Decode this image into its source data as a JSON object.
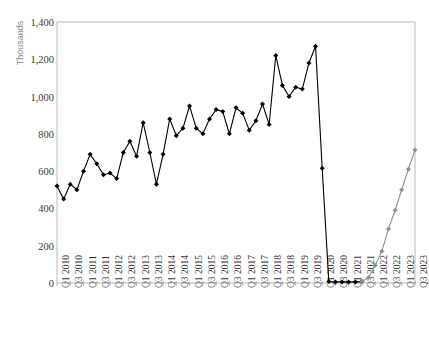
{
  "chart_data": {
    "type": "line",
    "title": "",
    "xlabel": "",
    "ylabel": "Thousands",
    "ylim": [
      0,
      1400
    ],
    "ytick_step": 200,
    "ytick_labels": [
      "1,400",
      "1,200",
      "1,000",
      "800",
      "600",
      "400",
      "200",
      "0"
    ],
    "ytick_values": [
      1400,
      1200,
      1000,
      800,
      600,
      400,
      200,
      0
    ],
    "grid": false,
    "legend": "none",
    "marker": "diamond",
    "x": [
      "Q1 2010",
      "Q2 2010",
      "Q3 2010",
      "Q4 2010",
      "Q1 2011",
      "Q2 2011",
      "Q3 2011",
      "Q4 2011",
      "Q1 2012",
      "Q2 2012",
      "Q3 2012",
      "Q4 2012",
      "Q1 2013",
      "Q2 2013",
      "Q3 2013",
      "Q4 2013",
      "Q1 2014",
      "Q2 2014",
      "Q3 2014",
      "Q4 2014",
      "Q1 2015",
      "Q2 2015",
      "Q3 2015",
      "Q4 2015",
      "Q1 2016",
      "Q2 2016",
      "Q3 2016",
      "Q4 2016",
      "Q1 2017",
      "Q2 2017",
      "Q3 2017",
      "Q4 2017",
      "Q1 2018",
      "Q2 2018",
      "Q3 2018",
      "Q4 2018",
      "Q1 2019",
      "Q2 2019",
      "Q3 2019",
      "Q4 2019",
      "Q1 2020",
      "Q2 2020",
      "Q3 2020",
      "Q4 2020",
      "Q1 2021",
      "Q2 2021",
      "Q3 2021",
      "Q4 2021",
      "Q1 2022",
      "Q2 2022",
      "Q3 2022",
      "Q4 2022",
      "Q1 2023",
      "Q2 2023",
      "Q3 2023"
    ],
    "xtick_labels": [
      "Q1 2010",
      "Q3 2010",
      "Q1 2011",
      "Q3 2011",
      "Q1 2012",
      "Q3 2012",
      "Q1 2013",
      "Q3 2013",
      "Q1 2014",
      "Q3 2014",
      "Q1 2015",
      "Q3 2015",
      "Q1 2016",
      "Q3 2016",
      "Q1 2017",
      "Q3 2017",
      "Q1 2018",
      "Q3 2018",
      "Q1 2019",
      "Q3 2019",
      "Q1 2020",
      "Q3 2020",
      "Q1 2021",
      "Q3 2021",
      "Q1 2022",
      "Q3 2022",
      "Q1 2023",
      "Q3 2023"
    ],
    "xtick_indices": [
      0,
      2,
      4,
      6,
      8,
      10,
      12,
      14,
      16,
      18,
      20,
      22,
      24,
      26,
      28,
      30,
      32,
      34,
      36,
      38,
      40,
      42,
      44,
      46,
      48,
      50,
      52,
      54
    ],
    "series": [
      {
        "name": "historical",
        "color": "#000000",
        "values": [
          520,
          450,
          530,
          500,
          600,
          690,
          640,
          580,
          590,
          560,
          700,
          760,
          680,
          860,
          700,
          530,
          690,
          880,
          790,
          830,
          950,
          830,
          800,
          880,
          930,
          920,
          800,
          940,
          910,
          820,
          870,
          960,
          850,
          1220,
          1060,
          1000,
          1050,
          1040,
          1180,
          1270,
          615,
          8,
          6,
          6,
          6,
          6,
          8,
          null,
          null,
          null,
          null,
          null,
          null,
          null,
          null
        ]
      },
      {
        "name": "recovery",
        "color": "#8f8f8f",
        "values": [
          null,
          null,
          null,
          null,
          null,
          null,
          null,
          null,
          null,
          null,
          null,
          null,
          null,
          null,
          null,
          null,
          null,
          null,
          null,
          null,
          null,
          null,
          null,
          null,
          null,
          null,
          null,
          null,
          null,
          null,
          null,
          null,
          null,
          null,
          null,
          null,
          null,
          null,
          null,
          null,
          null,
          null,
          null,
          null,
          null,
          null,
          8,
          30,
          95,
          170,
          290,
          390,
          500,
          610,
          713
        ]
      }
    ]
  }
}
